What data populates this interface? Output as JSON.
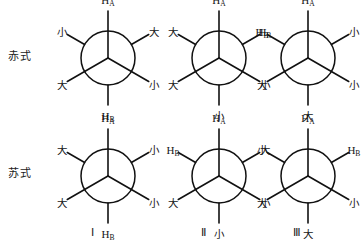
{
  "figure": {
    "background_color": "#ffffff",
    "line_color": "#111111"
  },
  "row_labels": [
    {
      "id": "erythro",
      "text": "赤式"
    },
    {
      "id": "threo",
      "text": "苏式"
    }
  ],
  "column_captions": [
    {
      "id": "col-1",
      "text": "Ⅰ"
    },
    {
      "id": "col-2",
      "text": "Ⅱ"
    },
    {
      "id": "col-3",
      "text": "Ⅲ"
    }
  ],
  "glyphs": {
    "large": "大",
    "small": "小",
    "h_a": "H",
    "h_a_sub": "A",
    "h_b": "H",
    "h_b_sub": "B"
  },
  "projections": [
    {
      "id": "erythro-1",
      "row": "赤式",
      "column": "Ⅰ",
      "positions": {
        "top": "H_A",
        "upper_left": "小",
        "upper_right": "大",
        "lower_left": "大",
        "lower_right": "小",
        "bottom": "H_B"
      },
      "labels": {
        "top": "H",
        "top_sub": "A",
        "upper_left": "小",
        "upper_right": "大",
        "lower_left": "大",
        "lower_right": "小",
        "bottom": "H",
        "bottom_sub": "B"
      }
    },
    {
      "id": "erythro-2",
      "row": "赤式",
      "column": "Ⅱ",
      "positions": {
        "top": "H_A",
        "upper_left": "大",
        "upper_right": "H_B",
        "lower_left": "大",
        "lower_right": "小",
        "bottom": "小"
      },
      "labels": {
        "top": "H",
        "top_sub": "A",
        "upper_left": "大",
        "upper_right": "H",
        "upper_right_sub": "B",
        "lower_left": "大",
        "lower_right": "小",
        "bottom": "小"
      }
    },
    {
      "id": "erythro-3",
      "row": "赤式",
      "column": "Ⅲ",
      "positions": {
        "top": "H_A",
        "upper_left": "H_B",
        "upper_right": "小",
        "lower_left": "大",
        "lower_right": "小",
        "bottom": "大"
      },
      "labels": {
        "top": "H",
        "top_sub": "A",
        "upper_left": "H",
        "upper_left_sub": "B",
        "upper_right": "小",
        "lower_left": "大",
        "lower_right": "小",
        "bottom": "大"
      }
    },
    {
      "id": "threo-1",
      "row": "苏式",
      "column": "Ⅰ",
      "positions": {
        "top": "H_A",
        "upper_left": "大",
        "upper_right": "小",
        "lower_left": "大",
        "lower_right": "小",
        "bottom": "H_B"
      },
      "labels": {
        "top": "H",
        "top_sub": "A",
        "upper_left": "大",
        "upper_right": "小",
        "lower_left": "大",
        "lower_right": "小",
        "bottom": "H",
        "bottom_sub": "B"
      }
    },
    {
      "id": "threo-2",
      "row": "苏式",
      "column": "Ⅱ",
      "positions": {
        "top": "H_A",
        "upper_left": "H_B",
        "upper_right": "大",
        "lower_left": "大",
        "lower_right": "小",
        "bottom": "小"
      },
      "labels": {
        "top": "H",
        "top_sub": "A",
        "upper_left": "H",
        "upper_left_sub": "B",
        "upper_right": "大",
        "lower_left": "大",
        "lower_right": "小",
        "bottom": "小"
      }
    },
    {
      "id": "threo-3",
      "row": "苏式",
      "column": "Ⅲ",
      "positions": {
        "top": "H_A",
        "upper_left": "小",
        "upper_right": "H_B",
        "lower_left": "大",
        "lower_right": "小",
        "bottom": "大"
      },
      "labels": {
        "top": "H",
        "top_sub": "A",
        "upper_left": "小",
        "upper_right": "H",
        "upper_right_sub": "B",
        "lower_left": "大",
        "lower_right": "小",
        "bottom": "大"
      }
    }
  ]
}
